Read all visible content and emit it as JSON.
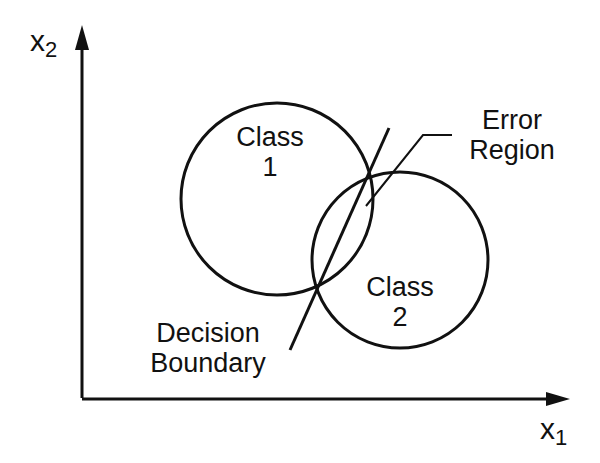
{
  "diagram": {
    "axes": {
      "x_label": "x",
      "x_subscript": "1",
      "y_label": "x",
      "y_subscript": "2"
    },
    "classes": [
      {
        "label_line1": "Class",
        "label_line2": "1"
      },
      {
        "label_line1": "Class",
        "label_line2": "2"
      }
    ],
    "error_region": {
      "line1": "Error",
      "line2": "Region"
    },
    "decision_boundary": {
      "line1": "Decision",
      "line2": "Boundary"
    },
    "colors": {
      "ink": "#111111",
      "background": "#ffffff"
    }
  }
}
